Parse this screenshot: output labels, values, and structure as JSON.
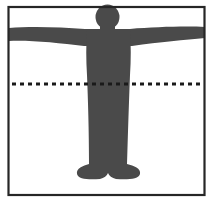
{
  "diagram": {
    "colors": {
      "frame": "#262626",
      "silhouette": "#4a4a4a",
      "dashed_line": "#1a1a1a",
      "background": "#ffffff"
    },
    "elements": {
      "frame": "bounding-box",
      "silhouette": "human-figure-arms-outstretched",
      "guide_line": "horizontal-dashed-line"
    }
  }
}
